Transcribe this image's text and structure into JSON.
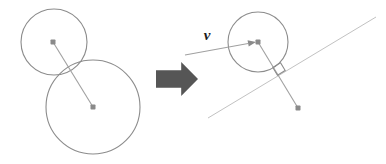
{
  "figure": {
    "title": "",
    "background_color": "#ffffff",
    "width": 386,
    "height": 164,
    "colors": {
      "circle_stroke": "#8c8c8c",
      "line_stroke": "#a0a0a0",
      "thin_line_stroke": "#c2c2c2",
      "dot_fill": "#8a8a8a",
      "block_arrow_fill": "#565656",
      "label_text": "#1c1c1c",
      "right_angle_stroke": "#8c8c8c"
    }
  },
  "left_panel": {
    "name": "before-state",
    "caption": "",
    "small_circle": {
      "label": "small-circle",
      "cx": 54,
      "cy": 42,
      "r": 33
    },
    "large_circle": {
      "label": "large-circle",
      "cx": 93,
      "cy": 107,
      "r": 47
    },
    "center_dot_small": {
      "label": "small-circle-center",
      "cx": 53,
      "cy": 42,
      "size": 5
    },
    "center_dot_large": {
      "label": "large-circle-center",
      "cx": 93,
      "cy": 107,
      "size": 5
    },
    "center_line": {
      "label": "line-of-centers",
      "x1": 53,
      "y1": 42,
      "x2": 93,
      "y2": 107
    }
  },
  "transition_arrow": {
    "name": "block-arrow-right",
    "icon": "arrow-right-block",
    "x": 156,
    "y": 62,
    "width": 42,
    "height": 34
  },
  "right_panel": {
    "name": "after-state",
    "caption": "",
    "circle": {
      "label": "moving-circle",
      "cx": 258,
      "cy": 42,
      "r": 30
    },
    "center_dot": {
      "label": "moving-circle-center",
      "cx": 258,
      "cy": 42,
      "size": 5
    },
    "target_dot": {
      "label": "target-point",
      "cx": 298,
      "cy": 108,
      "size": 5
    },
    "velocity_vector": {
      "label": "v",
      "name": "velocity-vector",
      "x1": 185,
      "y1": 55,
      "x2": 256,
      "y2": 42,
      "text_x": 207,
      "text_y": 40
    },
    "trajectory_line": {
      "label": "trajectory-line",
      "x1": 208,
      "y1": 118,
      "x2": 376,
      "y2": 17
    },
    "radius_line": {
      "label": "perpendicular-radius",
      "x1": 258,
      "y1": 42,
      "x2": 298,
      "y2": 108
    },
    "right_angle_marker": {
      "label": "right-angle-marker",
      "cx": 279,
      "cy": 69,
      "size": 9
    }
  }
}
